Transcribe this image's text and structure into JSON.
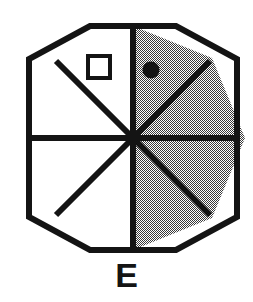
{
  "figure": {
    "label": "E",
    "shape_name": "octagon",
    "colors": {
      "outline": "#141414",
      "shaded_fill": "#9a9a9a",
      "unshaded_fill": "#ffffff",
      "background": "#ffffff",
      "label_color": "#141414",
      "marker_color": "#141414"
    },
    "geometry": {
      "center_x": 133,
      "center_y": 138,
      "circumradius": 112,
      "rotation_deg": 22.5,
      "stroke_width": 6,
      "sector_count": 8
    },
    "sectors": [
      {
        "index": 0,
        "name": "sector-top-right",
        "shaded": false
      },
      {
        "index": 1,
        "name": "sector-right-upper",
        "shaded": true
      },
      {
        "index": 2,
        "name": "sector-right-lower",
        "shaded": false
      },
      {
        "index": 3,
        "name": "sector-bottom-right",
        "shaded": true
      },
      {
        "index": 4,
        "name": "sector-bottom-left",
        "shaded": false
      },
      {
        "index": 5,
        "name": "sector-left-lower",
        "shaded": false
      },
      {
        "index": 6,
        "name": "sector-left-upper",
        "shaded": false
      },
      {
        "index": 7,
        "name": "sector-top-left",
        "shaded": false
      }
    ],
    "markers": [
      {
        "name": "square-marker",
        "kind": "square-outline",
        "filled": false,
        "cx": 99,
        "cy": 67,
        "size": 22,
        "stroke_width": 4
      },
      {
        "name": "dot-marker",
        "kind": "circle-filled",
        "filled": true,
        "cx": 151,
        "cy": 70,
        "radius": 8.5
      }
    ]
  }
}
